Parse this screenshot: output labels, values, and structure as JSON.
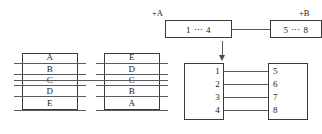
{
  "diagram": {
    "left_group": {
      "source_table": {
        "name": "source-stack",
        "rows": [
          "A",
          "B",
          "C",
          "D",
          "E"
        ]
      },
      "target_table": {
        "name": "target-stack",
        "rows": [
          "E",
          "D",
          "C",
          "B",
          "A"
        ]
      },
      "connector": {
        "from_row": "C",
        "to_row": "C"
      }
    },
    "right_group": {
      "top_left_box": {
        "label": "+A",
        "text": "1  ⋯  4"
      },
      "top_right_box": {
        "label": "+B",
        "text": "5  ⋯  8"
      },
      "arrow": "down-arrow",
      "bottom_left_box": {
        "items": [
          "1",
          "2",
          "3",
          "4"
        ]
      },
      "bottom_right_box": {
        "items": [
          "5",
          "6",
          "7",
          "8"
        ]
      }
    }
  },
  "colors": {
    "stroke": "#3a3a3a",
    "rule": "#5a5a5a",
    "text": "#1a1a1a",
    "background": "#ffffff"
  }
}
